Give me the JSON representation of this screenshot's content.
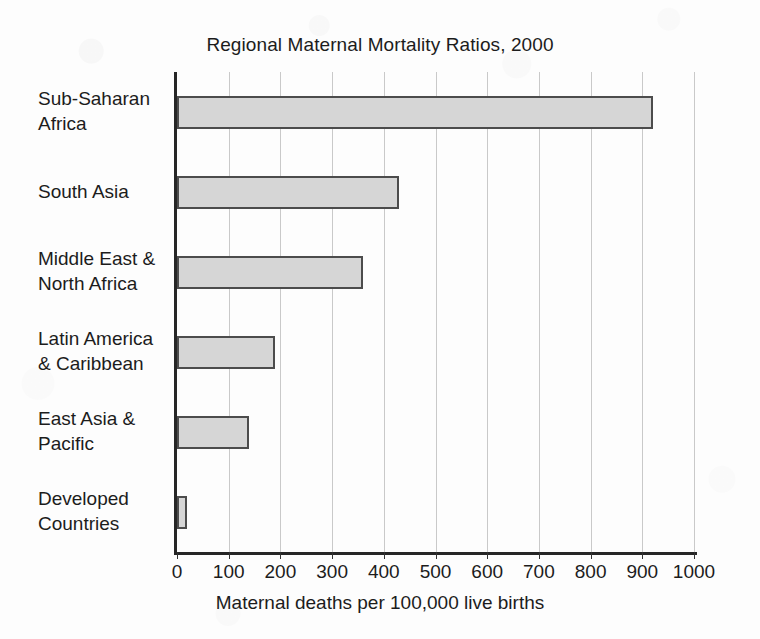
{
  "chart_data": {
    "type": "bar",
    "orientation": "horizontal",
    "title": "Regional Maternal Mortality Ratios, 2000",
    "xlabel": "Maternal deaths per 100,000 live births",
    "ylabel": "",
    "categories": [
      "Sub-Saharan Africa",
      "South Asia",
      "Middle East & North Africa",
      "Latin America & Caribbean",
      "East Asia & Pacific",
      "Developed Countries"
    ],
    "category_lines": [
      [
        "Sub-Saharan",
        "Africa"
      ],
      [
        "South Asia"
      ],
      [
        "Middle East &",
        "North Africa"
      ],
      [
        "Latin America",
        "& Caribbean"
      ],
      [
        "East Asia &",
        "Pacific"
      ],
      [
        "Developed",
        "Countries"
      ]
    ],
    "values": [
      920,
      430,
      360,
      190,
      140,
      20
    ],
    "xlim": [
      0,
      1000
    ],
    "xticks": [
      0,
      100,
      200,
      300,
      400,
      500,
      600,
      700,
      800,
      900,
      1000
    ],
    "xtick_labels": [
      "0",
      "100",
      "200",
      "300",
      "400",
      "500",
      "600",
      "700",
      "800",
      "900",
      "1000"
    ],
    "grid": "vertical",
    "legend": "none",
    "bar_fill_color": "#d6d6d6",
    "bar_border_color": "#4c4c4c",
    "gridline_color": "#c9c9c9",
    "axis_color": "#262626",
    "background_color": "#fdfdfd"
  }
}
